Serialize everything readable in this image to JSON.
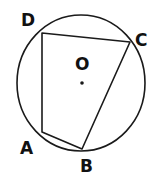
{
  "diagram": {
    "type": "cyclic-quadrilateral-in-circle",
    "stroke_color": "#1a1a1a",
    "circle": {
      "center_label": "O",
      "cx": 81,
      "cy": 83,
      "rx": 64,
      "ry": 68
    },
    "vertices": {
      "A": {
        "label": "A",
        "x": 42,
        "y": 132
      },
      "B": {
        "label": "B",
        "x": 82,
        "y": 149
      },
      "C": {
        "label": "C",
        "x": 130,
        "y": 42
      },
      "D": {
        "label": "D",
        "x": 42,
        "y": 33
      }
    },
    "labels": {
      "A": "A",
      "B": "B",
      "C": "C",
      "D": "D",
      "O": "O"
    },
    "segments": [
      "AB",
      "BC",
      "CD",
      "DA"
    ]
  }
}
